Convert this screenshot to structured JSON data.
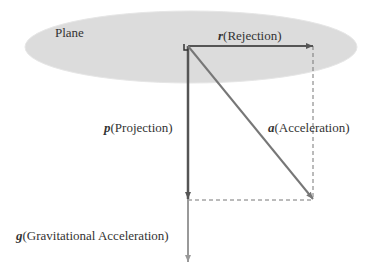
{
  "plane": {
    "label": "Plane",
    "fill": "#dcdcdc"
  },
  "vectors": {
    "rejection": {
      "symbol": "r",
      "label": "(Rejection)",
      "color": "#555555"
    },
    "projection": {
      "symbol": "p",
      "label": "(Projection)",
      "color": "#555555"
    },
    "acceleration": {
      "symbol": "a",
      "label": "(Acceleration)",
      "color": "#777777"
    },
    "gravity": {
      "symbol": "g",
      "label": "(Gravitational Acceleration)",
      "color": "#999999"
    }
  }
}
